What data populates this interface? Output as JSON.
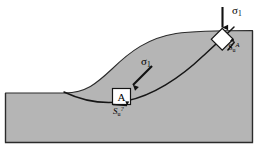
{
  "figure": {
    "name": "slope-stability-diagram",
    "caption_elements": {
      "major_principal_stress_top": "σ",
      "major_principal_stress_top_sub": "1",
      "major_principal_stress_mid": "σ",
      "major_principal_stress_mid_sub": "1",
      "element_a_letter": "A",
      "stress_symbol_top": "S",
      "stress_symbol_top_sub": "u",
      "stress_symbol_top_sup": "A",
      "stress_symbol_mid": "S",
      "stress_symbol_mid_sub": "u",
      "stress_symbol_mid_sup": "?"
    }
  },
  "colors": {
    "soil_fill": "#b5b5b5",
    "outline": "#1a1a1a",
    "element_fill": "#ffffff",
    "background": "#ffffff",
    "slip_surface": "#1a1a1a"
  },
  "geometry": {
    "frame_left": 5,
    "frame_right": 253,
    "frame_bottom": 143,
    "crest_y": 33,
    "toe_y": 93
  },
  "annotations": {
    "arrow_top_direction": "vertical-down",
    "arrow_mid_direction": "diagonal-down-left",
    "soil_element_top_shape": "rotated-square",
    "soil_element_mid_shape": "square"
  }
}
